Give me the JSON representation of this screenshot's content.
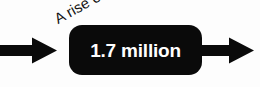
{
  "graphic": {
    "type": "flow-callout",
    "background_color": "#fdfdfd",
    "label": {
      "text": "A rise of",
      "color": "#131313",
      "rotation_degrees": -29
    },
    "pill": {
      "value_text": "1.7 million",
      "fill_color": "#0a0a0a",
      "text_color": "#ffffff"
    },
    "arrows": [
      {
        "name": "inbound-arrow",
        "direction": "right",
        "color": "#0a0a0a"
      },
      {
        "name": "outbound-arrow",
        "direction": "right",
        "color": "#0a0a0a"
      }
    ]
  }
}
